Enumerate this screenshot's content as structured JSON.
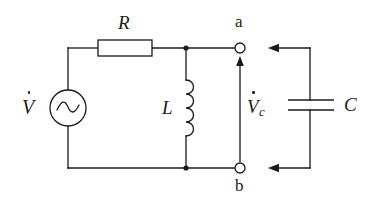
{
  "figure": {
    "kind": "electrical-circuit-schematic",
    "background_color": "#ffffff",
    "line_color": "#1a1a1a",
    "text_color": "#1a1a1a",
    "width": 377,
    "height": 208
  },
  "labels": {
    "source": {
      "symbol": "V",
      "accent": "dot",
      "subscript": "",
      "name": "voltage-source-label"
    },
    "resistor": {
      "symbol": "R",
      "name": "resistor-label"
    },
    "inductor": {
      "symbol": "L",
      "name": "inductor-label"
    },
    "capacitor": {
      "symbol": "C",
      "name": "capacitor-label"
    },
    "capacitor_voltage": {
      "symbol": "V",
      "accent": "dot",
      "subscript": "c",
      "name": "capacitor-voltage-label"
    },
    "terminal_a": {
      "symbol": "a",
      "name": "terminal-a-label"
    },
    "terminal_b": {
      "symbol": "b",
      "name": "terminal-b-label"
    }
  },
  "components": {
    "ac_source": {
      "type": "ac-voltage-source",
      "glyph": "sine-wave",
      "cx": 68,
      "cy": 108,
      "r": 18
    },
    "resistor": {
      "type": "resistor",
      "style": "rectangle-box",
      "x": 98,
      "y": 40,
      "w": 54,
      "h": 16
    },
    "inductor": {
      "type": "inductor",
      "style": "coil",
      "loops": 4,
      "x": 186,
      "y": 80,
      "height": 56
    },
    "capacitor": {
      "type": "capacitor",
      "style": "parallel-plates",
      "plate_x1": 288,
      "plate_x2": 334,
      "plate_y_top": 100,
      "plate_y_bottom": 110
    },
    "terminal_a": {
      "type": "open-terminal",
      "cx": 240,
      "cy": 48,
      "r": 5
    },
    "terminal_b": {
      "type": "open-terminal",
      "cx": 240,
      "cy": 168,
      "r": 5
    }
  },
  "arrows": {
    "capacitor_voltage_arrow": {
      "direction": "up",
      "x": 240,
      "y_from": 162,
      "y_to": 58
    },
    "top_loop_arrow": {
      "direction": "left",
      "y": 48,
      "x_from": 310,
      "x_to": 272
    },
    "bottom_loop_arrow": {
      "direction": "left",
      "y": 168,
      "x_from": 310,
      "x_to": 272
    }
  },
  "nodes": {
    "junction_top": {
      "x": 186,
      "y": 48
    },
    "junction_bottom": {
      "x": 186,
      "y": 168
    }
  }
}
